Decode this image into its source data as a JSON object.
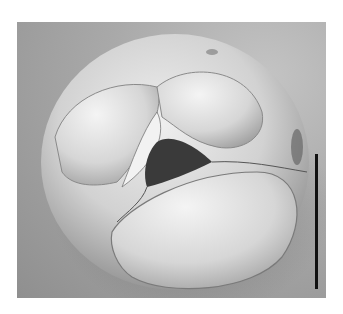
{
  "image": {
    "subject": "SEM micrograph of a foraminifer test (globular, multi-chambered, umbilical view)",
    "background_color": "#a8a8a8",
    "specimen_tone": "#d8d8d8",
    "aperture_tone": "#3a3a3a",
    "has_scale_bar": true,
    "scale_bar_color": "#111111",
    "scale_bar_orientation": "vertical"
  }
}
